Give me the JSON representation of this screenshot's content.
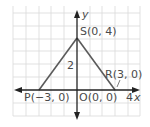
{
  "diagram": {
    "type": "coordinate-plane-triangle",
    "grid": {
      "x_min": -5,
      "x_max": 5,
      "y_min": -2,
      "y_max": 6,
      "step": 1
    },
    "axes": {
      "x_label": "x",
      "y_label": "y",
      "x_tick_label": "4",
      "y_tick_label": "2"
    },
    "points": [
      {
        "name": "P",
        "label": "P(−3, 0)",
        "x": -3,
        "y": 0
      },
      {
        "name": "O",
        "label": "O(0, 0)",
        "x": 0,
        "y": 0
      },
      {
        "name": "R",
        "label": "R(3, 0)",
        "x": 3,
        "y": 0
      },
      {
        "name": "S",
        "label": "S(0, 4)",
        "x": 0,
        "y": 4
      }
    ],
    "segments": [
      [
        "P",
        "S"
      ],
      [
        "S",
        "R"
      ],
      [
        "P",
        "R"
      ],
      [
        "S",
        "O"
      ]
    ],
    "colors": {
      "grid": "#d4d4d4",
      "axis": "#222222",
      "triangle": "#555555",
      "label": "#4a4a4a"
    }
  }
}
